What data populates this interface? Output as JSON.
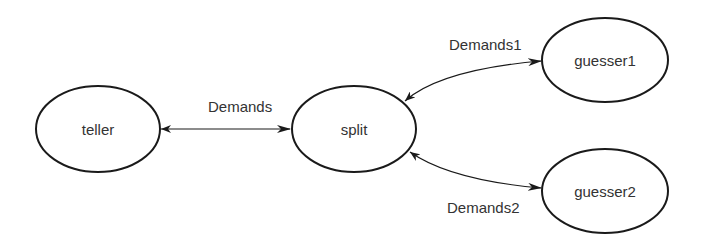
{
  "nodes": {
    "teller": {
      "label": "teller"
    },
    "split": {
      "label": "split"
    },
    "guesser1": {
      "label": "guesser1"
    },
    "guesser2": {
      "label": "guesser2"
    }
  },
  "edges": {
    "teller_split": {
      "label": "Demands"
    },
    "split_guesser1": {
      "label": "Demands1"
    },
    "split_guesser2": {
      "label": "Demands2"
    }
  },
  "colors": {
    "stroke": "#1a1a1a",
    "text": "#333333",
    "background": "#ffffff"
  }
}
